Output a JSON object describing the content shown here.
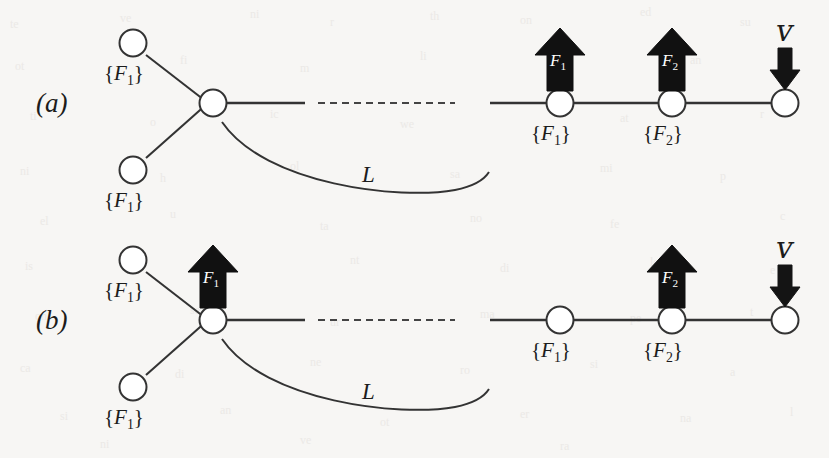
{
  "figure": {
    "background_color": "#f7f6f4",
    "ink_color": "#262626",
    "arrow_fill": "#111111",
    "arrow_text_color": "#ffffff",
    "node_fill": "#ffffff"
  },
  "panels": [
    {
      "id": "a",
      "label": "(a)",
      "velocity_label": "ᴠ",
      "curve_label": "L",
      "branch_node_labels": [
        "{F₁}",
        "{F₁}"
      ],
      "chain_node_labels": [
        "{F₁}",
        "{F₂}"
      ],
      "force_arrows": [
        {
          "name": "F1",
          "label": "F",
          "sub": "1",
          "position": "over-chain-node-1"
        },
        {
          "name": "F2",
          "label": "F",
          "sub": "2",
          "position": "over-chain-node-2"
        }
      ]
    },
    {
      "id": "b",
      "label": "(b)",
      "velocity_label": "ᴠ",
      "curve_label": "L",
      "branch_node_labels": [
        "{F₁}",
        "{F₁}"
      ],
      "chain_node_labels": [
        "{F₁}",
        "{F₂}"
      ],
      "force_arrows": [
        {
          "name": "F1",
          "label": "F",
          "sub": "1",
          "position": "over-junction-node"
        },
        {
          "name": "F2",
          "label": "F",
          "sub": "2",
          "position": "over-chain-node-2"
        }
      ]
    }
  ],
  "labels": {
    "panel_a": "(a)",
    "panel_b": "(b)",
    "set_f1": "{F₁}",
    "set_f2": "{F₂}",
    "curve_l": "L",
    "velocity": "ᴠ",
    "force_f": "F",
    "force_sub_1": "1",
    "force_sub_2": "2"
  }
}
